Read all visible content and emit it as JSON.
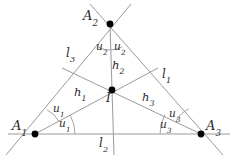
{
  "figure": {
    "type": "geometry-diagram",
    "width": 237,
    "height": 159,
    "background_color": "#ffffff",
    "line_color": "#9a9a9a",
    "point_color": "#000000",
    "text_color": "#2b2b2b"
  },
  "vertices": [
    {
      "name": "A1",
      "base": "A",
      "sub": "1",
      "x": 35,
      "y": 134,
      "label_x": 12,
      "label_y": 119
    },
    {
      "name": "A2",
      "base": "A",
      "sub": "2",
      "x": 110,
      "y": 24,
      "label_x": 83,
      "label_y": 9
    },
    {
      "name": "A3",
      "base": "A",
      "sub": "3",
      "x": 201,
      "y": 134,
      "label_x": 206,
      "label_y": 119
    }
  ],
  "incenter": {
    "name": "I",
    "base": "I",
    "sub": "",
    "x": 112,
    "y": 90,
    "label_x": 106,
    "label_y": 92
  },
  "side_labels": [
    {
      "name": "l1",
      "base": "l",
      "sub": "1",
      "x": 162,
      "y": 68
    },
    {
      "name": "l2",
      "base": "l",
      "sub": "2",
      "x": 99,
      "y": 137
    },
    {
      "name": "l3",
      "base": "l",
      "sub": "3",
      "x": 66,
      "y": 47
    }
  ],
  "bisector_labels": [
    {
      "name": "h1",
      "base": "h",
      "sub": "1",
      "x": 74,
      "y": 87
    },
    {
      "name": "h2",
      "base": "h",
      "sub": "2",
      "x": 112,
      "y": 60
    },
    {
      "name": "h3",
      "base": "h",
      "sub": "3",
      "x": 142,
      "y": 92
    }
  ],
  "angle_labels": [
    {
      "name": "u1-upper",
      "base": "u",
      "sub": "1",
      "x": 53,
      "y": 103
    },
    {
      "name": "u1-lower",
      "base": "u",
      "sub": "1",
      "x": 59,
      "y": 118
    },
    {
      "name": "u2-left",
      "base": "u",
      "sub": "2",
      "x": 96,
      "y": 41
    },
    {
      "name": "u2-right",
      "base": "u",
      "sub": "2",
      "x": 114,
      "y": 41
    },
    {
      "name": "u3-upper",
      "base": "u",
      "sub": "3",
      "x": 169,
      "y": 108
    },
    {
      "name": "u3-lower",
      "base": "u",
      "sub": "3",
      "x": 160,
      "y": 119
    }
  ],
  "segments": [
    {
      "name": "side-l3-extended",
      "x1": 6,
      "y1": 155,
      "x2": 131,
      "y2": 4
    },
    {
      "name": "side-l1-extended",
      "x1": 90,
      "y1": 4,
      "x2": 223,
      "y2": 155
    },
    {
      "name": "side-l2-baseline",
      "x1": 8,
      "y1": 134,
      "x2": 230,
      "y2": 134
    },
    {
      "name": "bisector-h1",
      "x1": 35,
      "y1": 134,
      "x2": 158,
      "y2": 68
    },
    {
      "name": "bisector-h3",
      "x1": 201,
      "y1": 134,
      "x2": 62,
      "y2": 68
    },
    {
      "name": "bisector-h2",
      "x1": 110,
      "y1": 24,
      "x2": 114,
      "y2": 155
    }
  ],
  "angle_arcs": [
    {
      "name": "arc-A1-upper",
      "cx": 35,
      "cy": 134,
      "r": 27,
      "start_deg": 296,
      "end_deg": 332
    },
    {
      "name": "arc-A1-lower",
      "cx": 35,
      "cy": 134,
      "r": 40,
      "start_deg": 332,
      "end_deg": 360
    },
    {
      "name": "arc-A2-left",
      "cx": 110,
      "cy": 24,
      "r": 26,
      "start_deg": 62,
      "end_deg": 88
    },
    {
      "name": "arc-A2-right",
      "cx": 110,
      "cy": 24,
      "r": 26,
      "start_deg": 88,
      "end_deg": 117
    },
    {
      "name": "arc-A3-upper",
      "cx": 201,
      "cy": 134,
      "r": 28,
      "start_deg": 208,
      "end_deg": 244
    },
    {
      "name": "arc-A3-lower",
      "cx": 201,
      "cy": 134,
      "r": 41,
      "start_deg": 180,
      "end_deg": 208
    }
  ]
}
